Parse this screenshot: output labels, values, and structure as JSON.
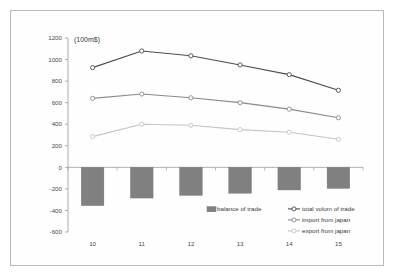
{
  "figure": {
    "unit_label": "(100m$)",
    "background_color": "#ffffff",
    "frame_color": "#b9b9b9"
  },
  "chart_data": {
    "type": "line",
    "title": "",
    "subtitle": "",
    "xlabel": "",
    "ylabel": "",
    "unit_annotation": "(100m$)",
    "categories": [
      "10",
      "11",
      "12",
      "13",
      "14",
      "15"
    ],
    "x_tick_labels": [
      "10",
      "11",
      "12",
      "13",
      "14",
      "15"
    ],
    "y_tick_labels": [
      "1200",
      "1000",
      "800",
      "600",
      "400",
      "200",
      "0",
      "-200",
      "-400",
      "-600"
    ],
    "y_tick_values": [
      1200,
      1000,
      800,
      600,
      400,
      200,
      0,
      -200,
      -400,
      -600
    ],
    "ylim": [
      -600,
      1200
    ],
    "grid": false,
    "legend_position": "inside-lower-right",
    "series": [
      {
        "name": "balance of trade",
        "type": "bar",
        "color": "#808080",
        "values": [
          -355,
          -285,
          -260,
          -240,
          -210,
          -195
        ]
      },
      {
        "name": "total volum of trade",
        "type": "line",
        "color": "#4d4d4d",
        "marker": "circle-open",
        "values": [
          925,
          1080,
          1035,
          950,
          860,
          715
        ]
      },
      {
        "name": "import from japan",
        "type": "line",
        "color": "#8a8a8a",
        "marker": "circle-open",
        "values": [
          640,
          680,
          645,
          600,
          540,
          460
        ]
      },
      {
        "name": "export from japan",
        "type": "line",
        "color": "#c4c4c4",
        "marker": "circle-open",
        "values": [
          285,
          400,
          390,
          350,
          325,
          260
        ]
      }
    ]
  },
  "legend": {
    "entries": [
      {
        "label": "balance of trade",
        "marker": "bar-swatch",
        "color": "#808080"
      },
      {
        "label": "total volum of trade",
        "marker": "line-circle",
        "color": "#4d4d4d"
      },
      {
        "label": "import from japan",
        "marker": "line-circle",
        "color": "#8a8a8a"
      },
      {
        "label": "export from japan",
        "marker": "line-circle",
        "color": "#c4c4c4"
      }
    ]
  }
}
